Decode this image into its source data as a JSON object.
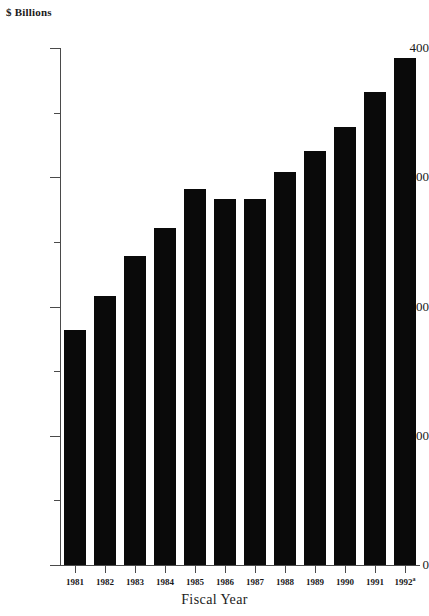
{
  "chart_data": {
    "type": "bar",
    "title": "",
    "xlabel": "Fiscal Year",
    "ylabel": "$ Billions",
    "categories": [
      "1981",
      "1982",
      "1983",
      "1984",
      "1985",
      "1986",
      "1987",
      "1988",
      "1989",
      "1990",
      "1991",
      "1992"
    ],
    "category_labels": [
      "1981",
      "1982",
      "1983",
      "1984",
      "1985",
      "1986",
      "1987",
      "1988",
      "1989",
      "1990",
      "1991",
      "1992"
    ],
    "category_superscripts": [
      "",
      "",
      "",
      "",
      "",
      "",
      "",
      "",
      "",
      "",
      "",
      "a"
    ],
    "values": [
      182,
      208,
      239,
      261,
      291,
      283,
      283,
      304,
      320,
      339,
      366,
      392
    ],
    "ylim": [
      0,
      400
    ],
    "ytick_values": [
      0,
      100,
      200,
      300,
      400
    ],
    "ytick_labels": [
      "0",
      "100",
      "200",
      "300",
      "400"
    ],
    "yminor_tick_values": [
      50,
      150,
      250,
      350
    ],
    "grid": false,
    "legend": null,
    "bar_color": "#0a0a0a",
    "axis_color": "#4a4a4a",
    "background_color": "#ffffff"
  },
  "axis": {
    "unit_label": "$ Billions",
    "x_title": "Fiscal Year"
  }
}
